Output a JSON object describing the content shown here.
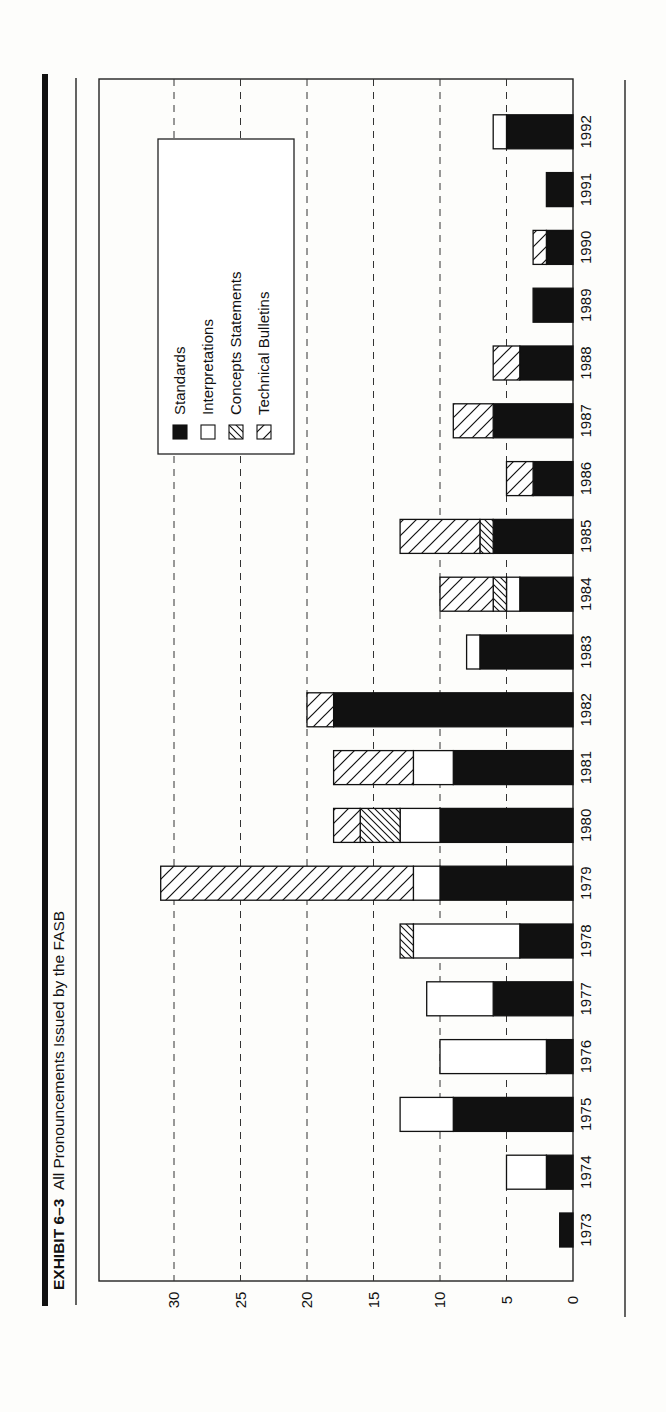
{
  "exhibit": {
    "label": "EXHIBIT 6–3",
    "title": "All Pronouncements Issued by the FASB"
  },
  "legend": {
    "items": [
      {
        "key": "standards",
        "label": "Standards",
        "fill": "solid-black"
      },
      {
        "key": "interpretations",
        "label": "Interpretations",
        "fill": "white"
      },
      {
        "key": "concepts",
        "label": "Concepts Statements",
        "fill": "hatch-backslash"
      },
      {
        "key": "bulletins",
        "label": "Technical Bulletins",
        "fill": "hatch-slash"
      }
    ]
  },
  "colors": {
    "ink": "#111111",
    "paper": "#fdfdfb",
    "grid": "#222222"
  },
  "chart_data": {
    "type": "bar",
    "orientation": "horizontal-stacked (page rotated 90°)",
    "title": "All Pronouncements Issued by the FASB",
    "xlabel": "",
    "ylabel": "",
    "ylim": [
      0,
      35
    ],
    "yticks": [
      0,
      5,
      10,
      15,
      20,
      25,
      30
    ],
    "grid": "dashed at every 5 units",
    "legend_position": "upper-left (inside plot, rotated)",
    "categories": [
      "1973",
      "1974",
      "1975",
      "1976",
      "1977",
      "1978",
      "1979",
      "1980",
      "1981",
      "1982",
      "1983",
      "1984",
      "1985",
      "1986",
      "1987",
      "1988",
      "1989",
      "1990",
      "1991",
      "1992"
    ],
    "series": [
      {
        "name": "Standards",
        "values": [
          1,
          2,
          9,
          2,
          6,
          4,
          10,
          10,
          9,
          18,
          7,
          4,
          6,
          3,
          6,
          4,
          3,
          2,
          2,
          5
        ]
      },
      {
        "name": "Interpretations",
        "values": [
          0,
          3,
          4,
          8,
          5,
          8,
          2,
          3,
          3,
          0,
          1,
          1,
          0,
          0,
          0,
          0,
          0,
          0,
          0,
          1
        ]
      },
      {
        "name": "Concepts Statements",
        "values": [
          0,
          0,
          0,
          0,
          0,
          1,
          0,
          3,
          0,
          0,
          0,
          1,
          1,
          0,
          0,
          0,
          0,
          0,
          0,
          0
        ]
      },
      {
        "name": "Technical Bulletins",
        "values": [
          0,
          0,
          0,
          0,
          0,
          0,
          19,
          2,
          6,
          2,
          0,
          4,
          6,
          2,
          3,
          2,
          0,
          1,
          0,
          0
        ]
      }
    ]
  }
}
